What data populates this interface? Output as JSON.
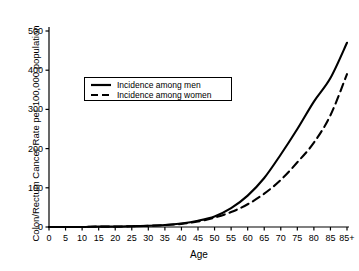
{
  "chart_data": {
    "type": "line",
    "title": "",
    "xlabel": "Age",
    "ylabel": "Colon/Rectum Cancer Rate per 100,000 population",
    "xlim": [
      0,
      90
    ],
    "ylim": [
      0,
      500
    ],
    "grid": false,
    "legend_position": "upper-left-inside",
    "x_tick_labels": [
      "0",
      "5",
      "10",
      "15",
      "20",
      "25",
      "30",
      "35",
      "40",
      "45",
      "50",
      "55",
      "60",
      "65",
      "70",
      "75",
      "80",
      "85",
      "85+"
    ],
    "x_tick_values": [
      0,
      5,
      10,
      15,
      20,
      25,
      30,
      35,
      40,
      45,
      50,
      55,
      60,
      65,
      70,
      75,
      80,
      85,
      90
    ],
    "y_tick_labels": [
      "0",
      "100",
      "200",
      "300",
      "400",
      "500"
    ],
    "y_tick_values": [
      0,
      100,
      200,
      300,
      400,
      500
    ],
    "x": [
      0,
      5,
      10,
      15,
      20,
      25,
      30,
      35,
      40,
      45,
      50,
      55,
      60,
      65,
      70,
      75,
      80,
      85,
      90
    ],
    "series": [
      {
        "name": "Incidence among men",
        "style": "solid",
        "color": "#000000",
        "values": [
          0,
          0,
          0,
          1,
          1,
          2,
          3,
          5,
          9,
          16,
          27,
          48,
          80,
          125,
          185,
          250,
          320,
          380,
          470
        ]
      },
      {
        "name": "Incidence among women",
        "style": "dashed",
        "color": "#000000",
        "values": [
          0,
          0,
          0,
          1,
          1,
          2,
          3,
          5,
          8,
          14,
          24,
          38,
          58,
          85,
          120,
          165,
          215,
          285,
          390
        ]
      }
    ],
    "legend": [
      {
        "label": "Incidence among men",
        "style": "solid"
      },
      {
        "label": "Incidence among women",
        "style": "dashed"
      }
    ]
  },
  "colors": {
    "axis": "#000000",
    "series": "#000000",
    "background": "#ffffff"
  }
}
